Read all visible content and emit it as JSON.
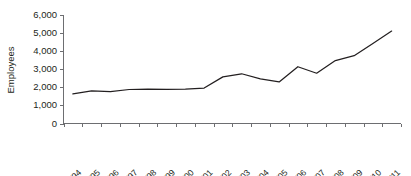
{
  "chart_data": {
    "type": "line",
    "title": "",
    "xlabel": "",
    "ylabel": "Employees",
    "ylim": [
      0,
      6000
    ],
    "ytick_values": [
      0,
      1000,
      2000,
      3000,
      4000,
      5000,
      6000
    ],
    "ytick_labels": [
      "0",
      "1,000",
      "2,000",
      "3,000",
      "4,000",
      "5,000",
      "6,000"
    ],
    "grid": false,
    "legend": false,
    "legend_position": "none",
    "categories": [
      "1993/94",
      "1994/95",
      "1995/96",
      "1996/97",
      "1997/98",
      "1998/99",
      "1999/00",
      "2000/01",
      "2001/02",
      "2002/03",
      "2003/04",
      "2004/05",
      "2005/06",
      "2006/07",
      "2007/08",
      "2008/09",
      "2009/10",
      "2010/11"
    ],
    "series": [
      {
        "name": "Employees",
        "values": [
          1640,
          1800,
          1760,
          1880,
          1900,
          1890,
          1900,
          1960,
          2580,
          2750,
          2470,
          2300,
          3140,
          2780,
          3480,
          3750,
          4420,
          5110
        ]
      }
    ]
  },
  "style": {
    "line_color": "#231f20",
    "axis_color": "#6d6e71",
    "background": "#ffffff"
  }
}
